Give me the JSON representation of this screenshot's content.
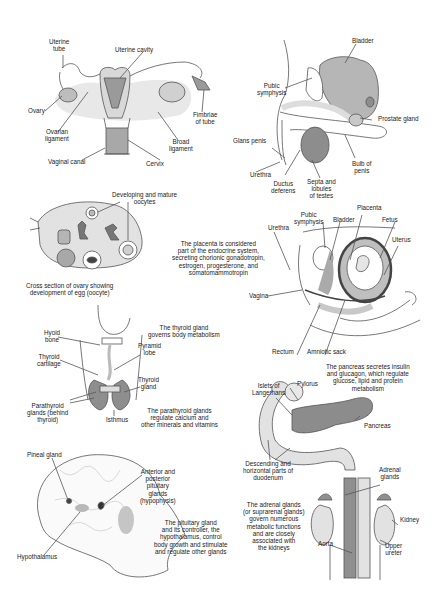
{
  "panels": {
    "female_reproductive": {
      "labels": {
        "uterine_tube": "Uterine\ntube",
        "uterine_cavity": "Uterine cavity",
        "ovary": "Ovary",
        "fimbriae": "Fimbriae\nof tube",
        "ovarian_ligament": "Ovarian\nligament",
        "broad_ligament": "Broad\nligament",
        "vaginal_canal": "Vaginal canal",
        "cervix": "Cervix"
      }
    },
    "male_reproductive": {
      "labels": {
        "bladder": "Bladder",
        "pubic_symphysis": "Pubic\nsymphysis",
        "prostate_gland": "Prostate gland",
        "glans_penis": "Glans penis",
        "bulb_of_penis": "Bulb of\npenis",
        "urethra": "Urethra",
        "ductus_deferens": "Ductus\ndeferens",
        "septa_lobules": "Septa and\nlobules\nof testes"
      }
    },
    "ovary_cross_section": {
      "labels": {
        "oocytes": "Developing and mature\noocytes"
      },
      "caption": "Cross section of ovary showing\ndevelopment of egg (oocyte)"
    },
    "pregnancy": {
      "labels": {
        "pubic_symphysis": "Pubic\nsymphysis",
        "bladder": "Bladder",
        "placenta": "Placenta",
        "fetus": "Fetus",
        "urethra": "Urethra",
        "uterus": "Uterus",
        "vagina": "Vagina",
        "rectum": "Rectum",
        "amniotic_sack": "Amniotic sack"
      },
      "description": "The placenta is considered\npart of the endocrine system,\nsecreting chorionic gonadotropin,\nestrogen, progesterone, and\nsomatomammotropin"
    },
    "thyroid": {
      "labels": {
        "hyoid_bone": "Hyoid\nbone",
        "thyroid_cartilage": "Thyroid\ncartilage",
        "pyramid_lobe": "Pyramid\nlobe",
        "thyroid_gland": "Thyroid\ngland",
        "parathyroid": "Parathyroid\nglands (behind\nthyroid)",
        "isthmus": "Isthmus"
      },
      "description_thyroid": "The thyroid gland\ngoverns body metabolism",
      "description_parathyroid": "The parathyroid glands\nregulate calcium and\nother minerals and vitamins"
    },
    "pancreas": {
      "labels": {
        "islets": "Islets of\nLangerhans",
        "pylorus": "Pylorus",
        "pancreas": "Pancreas",
        "duodenum": "Descending and\nhorizontal parts of\nduodenum"
      },
      "description": "The pancreas secretes insulin\nand glucagon, which regulate\nglucose, lipid and protein\nmetabolism"
    },
    "brain": {
      "labels": {
        "pineal_gland": "Pineal gland",
        "pituitary": "Anterior and\nposterior\npituitary\nglands\n(hypophysis)",
        "hypothalamus": "Hypothalamus"
      },
      "description": "The pituitary gland\nand its controller, the\nhypothalamus, control\nbody growth and stimulate\nand regulate other glands"
    },
    "adrenal": {
      "labels": {
        "adrenal_glands": "Adrenal\nglands",
        "kidney": "Kidney",
        "aorta": "Aorta",
        "upper_ureter": "Upper\nureter"
      },
      "description": "The adrenal glands\n(or suprarenal glands)\ngovern numerous\nmetabolic functions\nand are closely\nassociated with\nthe kidneys"
    }
  },
  "colors": {
    "light_gray": "#e6e6e6",
    "mid_gray": "#b9b9b9",
    "dark_gray": "#7a7a7a",
    "line": "#4a4a4a"
  }
}
